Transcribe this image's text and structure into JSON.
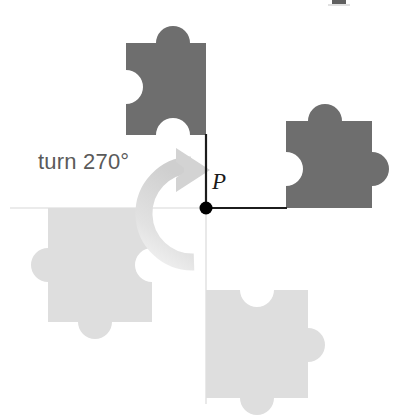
{
  "figure": {
    "caption_text": "turn 270°",
    "point_label": "P",
    "rotation_degrees": "270",
    "rotation_direction": "clockwise",
    "colors": {
      "piece_dark": "#6e6e6e",
      "piece_light": "#dedede",
      "arrow": "#d5d5d5",
      "axis_dark": "#1a1a1a",
      "axis_faint": "#e3e3e3",
      "center_dot": "#000000",
      "text": "#5a5a5a",
      "background": "#ffffff"
    },
    "center_point": {
      "x": 206,
      "y": 208
    },
    "pieces": [
      {
        "name": "piece-top-dark",
        "shade": "dark",
        "quadrant": "upper-left",
        "edges": {
          "top": "tab",
          "right": "flat",
          "bottom": "blank",
          "left": "tab"
        }
      },
      {
        "name": "piece-right-dark",
        "shade": "dark",
        "quadrant": "upper-right",
        "edges": {
          "top": "tab",
          "right": "tab",
          "bottom": "flat",
          "left": "blank"
        }
      },
      {
        "name": "piece-left-light",
        "shade": "light",
        "quadrant": "lower-left",
        "edges": {
          "top": "flat",
          "right": "blank",
          "bottom": "tab",
          "left": "tab"
        }
      },
      {
        "name": "piece-bottom-light",
        "shade": "light",
        "quadrant": "lower-right",
        "edges": {
          "top": "blank",
          "right": "tab",
          "bottom": "tab",
          "left": "flat"
        }
      }
    ],
    "axes": [
      {
        "name": "axis-up-dark",
        "from": "center",
        "to": "up",
        "style": "dark"
      },
      {
        "name": "axis-right-dark",
        "from": "center",
        "to": "right",
        "style": "dark"
      },
      {
        "name": "axis-left-faint",
        "from": "center",
        "to": "left",
        "style": "faint"
      },
      {
        "name": "axis-down-faint",
        "from": "center",
        "to": "down",
        "style": "faint"
      }
    ]
  }
}
